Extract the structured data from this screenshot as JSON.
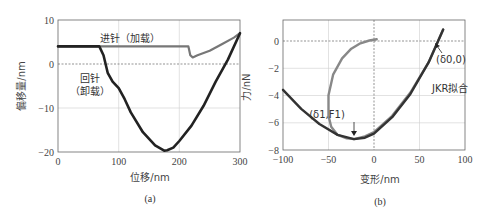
{
  "chart_data": [
    {
      "type": "line",
      "panel": "(a)",
      "title": "",
      "xlabel": "位移/nm",
      "ylabel": "偏移量/nm",
      "xlim": [
        0,
        300
      ],
      "ylim": [
        -20,
        10
      ],
      "xticks": [
        "0",
        "100",
        "200",
        "300"
      ],
      "yticks": [
        "10",
        "0",
        "-10",
        "-20"
      ],
      "grid": true,
      "annotations": [
        "进针（加载）",
        "回针（卸载）"
      ],
      "series": [
        {
          "name": "进针（加载）",
          "color": "#777777",
          "x": [
            0,
            50,
            100,
            150,
            200,
            215,
            218,
            222,
            230,
            250,
            270,
            290,
            300
          ],
          "y": [
            4,
            4,
            4,
            4,
            4,
            4,
            2,
            1.5,
            2,
            3,
            4.5,
            6,
            7
          ]
        },
        {
          "name": "回针（卸载）",
          "color": "#222222",
          "x": [
            0,
            40,
            68,
            75,
            82,
            90,
            100,
            110,
            120,
            140,
            160,
            175,
            180,
            190,
            200,
            220,
            240,
            260,
            280,
            300
          ],
          "y": [
            4,
            4,
            4,
            2,
            -2,
            -4,
            -5.5,
            -8,
            -11,
            -15.5,
            -18.5,
            -19.7,
            -19.6,
            -19,
            -17.5,
            -14,
            -9.5,
            -4,
            1,
            7
          ]
        }
      ]
    },
    {
      "type": "line",
      "panel": "(b)",
      "title": "",
      "xlabel": "变形/nm",
      "ylabel": "力/nN",
      "xlim": [
        -100,
        100
      ],
      "ylim": [
        -8,
        1.5
      ],
      "xticks": [
        "-100",
        "-50",
        "0",
        "50",
        "100"
      ],
      "yticks": [
        "0",
        "-2",
        "-4",
        "-6",
        "-8"
      ],
      "grid": true,
      "annotations": [
        "(δ0,0)",
        "(δ1,F1)",
        "JKR拟合"
      ],
      "series": [
        {
          "name": "loading",
          "color": "#888888",
          "x": [
            3,
            -5,
            -15,
            -25,
            -35,
            -45,
            -50,
            -50,
            -47,
            -40,
            -30,
            -22,
            -10,
            0,
            20,
            40,
            60,
            76
          ],
          "y": [
            0.1,
            0,
            -0.2,
            -0.6,
            -1.3,
            -2.5,
            -4,
            -5.5,
            -6.3,
            -6.9,
            -7.15,
            -7.2,
            -7.0,
            -6.7,
            -5.5,
            -3.8,
            -1.6,
            0.8
          ]
        },
        {
          "name": "JKR拟合",
          "color": "#333333",
          "x": [
            -100,
            -80,
            -60,
            -40,
            -22,
            -10,
            0,
            20,
            40,
            60,
            76
          ],
          "y": [
            -3.6,
            -5.0,
            -6.1,
            -6.9,
            -7.2,
            -7.1,
            -6.8,
            -5.6,
            -3.9,
            -1.6,
            0.8
          ]
        }
      ]
    }
  ],
  "panels": {
    "a": {
      "caption": "(a)",
      "xlabel": "位移/nm",
      "ylabel": "偏移量/nm",
      "xticks": [
        "0",
        "100",
        "200",
        "300"
      ],
      "yticks": [
        "10",
        "0",
        "−10",
        "−20"
      ],
      "label_loading": "进针（加载）",
      "label_unloading_1": "回针",
      "label_unloading_2": "（卸载）"
    },
    "b": {
      "caption": "(b)",
      "xlabel": "变形/nm",
      "ylabel": "力/nN",
      "xticks": [
        "−100",
        "−50",
        "0",
        "50",
        "100"
      ],
      "yticks": [
        "0",
        "−2",
        "−4",
        "−6",
        "−8"
      ],
      "label_delta0": "(δ0,0)",
      "label_delta1": "(δ1,F1)",
      "label_jkr": "JKR拟合"
    }
  }
}
